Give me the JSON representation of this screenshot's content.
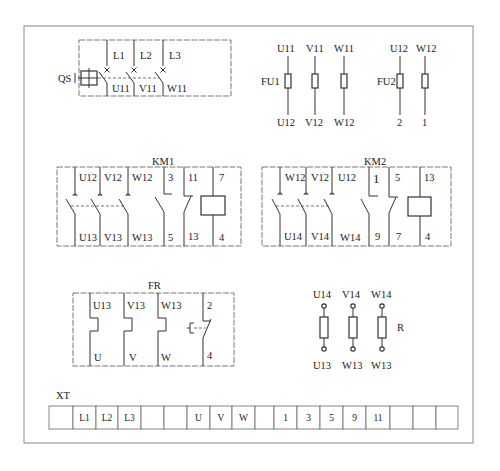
{
  "diagram": {
    "qs": {
      "label": "QS",
      "top_labels": [
        "L1",
        "L2",
        "L3"
      ],
      "bottom_labels": [
        "U11",
        "V11",
        "W11"
      ]
    },
    "fu1": {
      "label": "FU1",
      "top_labels": [
        "U11",
        "V11",
        "W11"
      ],
      "bottom_labels": [
        "U12",
        "V12",
        "W12"
      ]
    },
    "fu2": {
      "label": "FU2",
      "top_labels": [
        "U12",
        "W12"
      ],
      "bottom_labels": [
        "2",
        "1"
      ]
    },
    "km1": {
      "label": "KM1",
      "top_labels": [
        "U12",
        "V12",
        "W12",
        "3",
        "11",
        "7"
      ],
      "bottom_labels": [
        "U13",
        "V13",
        "W13",
        "5",
        "13",
        "4"
      ]
    },
    "km2": {
      "label": "KM2",
      "top_labels": [
        "W12",
        "V12",
        "U12",
        "1",
        "5",
        "13"
      ],
      "bottom_labels": [
        "U14",
        "V14",
        "W14",
        "9",
        "7",
        "4"
      ]
    },
    "fr": {
      "label": "FR",
      "top_labels": [
        "U13",
        "V13",
        "W13",
        "2"
      ],
      "bottom_labels": [
        "U",
        "V",
        "W",
        "4"
      ]
    },
    "r": {
      "label": "R",
      "top_labels": [
        "U14",
        "V14",
        "W14"
      ],
      "bottom_labels": [
        "U13",
        "W13",
        "W13"
      ]
    },
    "xt": {
      "label": "XT",
      "cells": [
        "",
        "L1",
        "L2",
        "L3",
        "",
        "",
        "U",
        "V",
        "W",
        "",
        "1",
        "3",
        "5",
        "9",
        "11",
        "",
        "",
        ""
      ]
    }
  }
}
